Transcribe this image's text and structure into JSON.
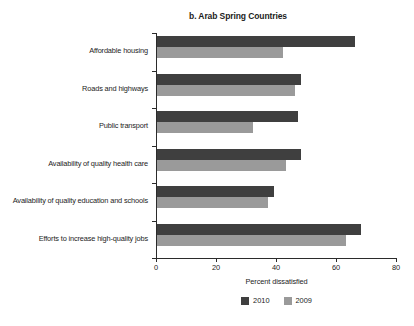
{
  "chart_data": {
    "type": "bar",
    "orientation": "horizontal",
    "title": "b. Arab Spring Countries",
    "xlabel": "Percent dissatisfied",
    "ylabel": "",
    "xlim": [
      0,
      80
    ],
    "xticks": [
      0,
      20,
      40,
      60,
      80
    ],
    "xtick_labels": [
      "0",
      "20",
      "40",
      "60",
      "80"
    ],
    "grid": false,
    "legend_position": "bottom-center",
    "categories": [
      "Affordable housing",
      "Roads and highways",
      "Public transport",
      "Availability of quality health care",
      "Availability of quality education and schools",
      "Efforts to increase high-quality jobs"
    ],
    "series": [
      {
        "name": "2010",
        "color": "#3f3f3f",
        "values": [
          66,
          48,
          47,
          48,
          39,
          68
        ]
      },
      {
        "name": "2009",
        "color": "#9a9a9a",
        "values": [
          42,
          46,
          32,
          43,
          37,
          63
        ]
      }
    ]
  },
  "legend": {
    "items": [
      {
        "label": "2010",
        "color": "#3f3f3f"
      },
      {
        "label": "2009",
        "color": "#9a9a9a"
      }
    ]
  },
  "footer": {
    "source_fragment": ""
  }
}
